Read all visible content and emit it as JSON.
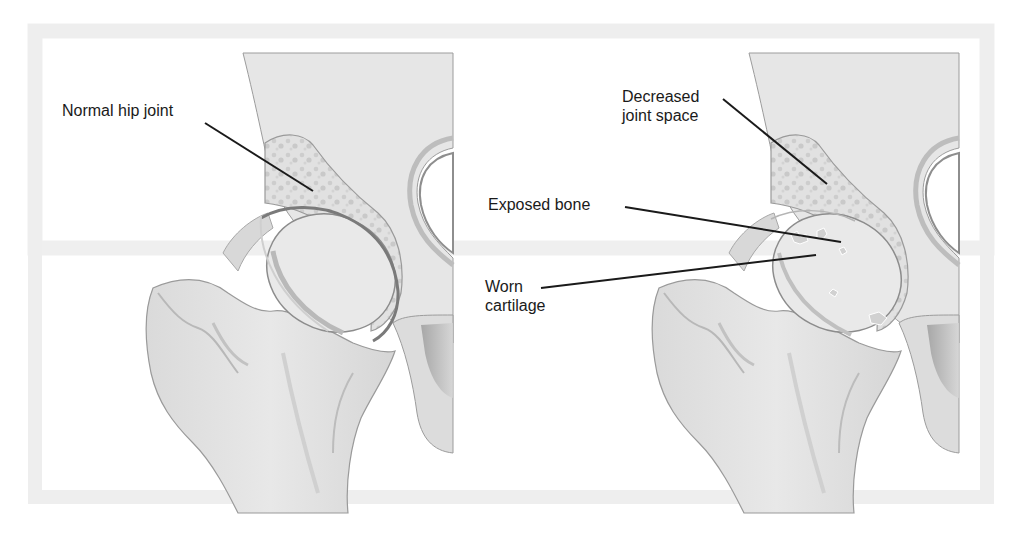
{
  "diagram": {
    "colors": {
      "background": "#ffffff",
      "frame": "#ececec",
      "bone_fill": "#e3e3e3",
      "bone_dark": "#c8c8c8",
      "bone_shadow": "#a9a9a9",
      "spongy_bone": "#d2d2d2",
      "outline": "#8a8a8a",
      "leader_line": "#1a1a1a",
      "label_text": "#1a1a1a"
    },
    "panels": [
      {
        "id": "normal",
        "labels": [
          {
            "text": "Normal hip joint",
            "x": 62,
            "y": 110,
            "target": [
              313,
              191
            ]
          }
        ]
      },
      {
        "id": "osteoarthritis",
        "labels": [
          {
            "text": "Decreased\njoint space",
            "x": 622,
            "y": 95,
            "target": [
              827,
              184
            ]
          },
          {
            "text": "Exposed bone",
            "x": 488,
            "y": 196,
            "target": [
              841,
              242
            ]
          },
          {
            "text": "Worn\ncartilage",
            "x": 485,
            "y": 274,
            "target": [
              816,
              255
            ]
          }
        ]
      }
    ]
  }
}
